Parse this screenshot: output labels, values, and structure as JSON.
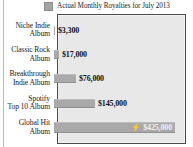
{
  "legend": {
    "swatch_name": "series-swatch",
    "label": "Actual Monthly Royalties for July 2013",
    "swatch_color": "#a3a3a3"
  },
  "chart_data": {
    "type": "bar",
    "orientation": "horizontal",
    "title": "",
    "subtitle": "",
    "xlabel": "",
    "ylabel": "",
    "grid": false,
    "legend_position": "top",
    "legend_entries": [
      "Actual Monthly Royalties for July 2013"
    ],
    "xlim": [
      0,
      470000
    ],
    "categories": [
      "Niche Indie Album",
      "Classic Rock Album",
      "Breakthrough Indie Album",
      "Spotify Top 10 Album",
      "Global Hit Album"
    ],
    "values": [
      3300,
      17000,
      76000,
      145000,
      425000
    ],
    "value_labels": [
      "$3,300",
      "$17,000",
      "$76,000",
      "$145,000",
      "$425,000"
    ],
    "bar_color": "#a9a9a9",
    "annotations": [
      {
        "category": "Global Hit Album",
        "icon": "lightning-bolt-icon",
        "glyph": "⚡",
        "label": "$425,000",
        "label_color": "#f2f2f2",
        "inside_bar": true
      }
    ]
  },
  "rows": [
    {
      "label_line1": "Niche Indie",
      "label_line2": "Album",
      "value_label": "$3,300",
      "bar_px": 1,
      "highlight": false
    },
    {
      "label_line1": "Classic Rock",
      "label_line2": "Album",
      "value_label": "$17,000",
      "bar_px": 5,
      "highlight": false
    },
    {
      "label_line1": "Breakthrough",
      "label_line2": "Indie Album",
      "value_label": "$76,000",
      "bar_px": 22,
      "highlight": false
    },
    {
      "label_line1": "Spotify",
      "label_line2": "Top 10 Album",
      "value_label": "$145,000",
      "bar_px": 41,
      "highlight": false
    },
    {
      "label_line1": "Global Hit",
      "label_line2": "Album",
      "value_label": "$425,000",
      "bar_px": 121,
      "highlight": true,
      "icon_glyph": "⚡"
    }
  ]
}
